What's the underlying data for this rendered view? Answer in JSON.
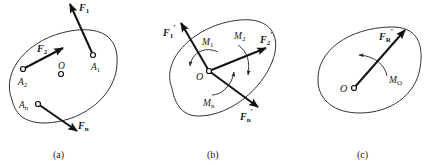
{
  "figure": {
    "panels": [
      {
        "id": "a",
        "caption": "(a)",
        "points": {
          "A1": "A",
          "A1_sub": "1",
          "A2": "A",
          "A2_sub": "2",
          "An": "A",
          "An_sub": "n",
          "O": "O"
        },
        "forces": {
          "F1": "F",
          "F1_sub": "1",
          "F2": "F",
          "F2_sub": "2",
          "Fn": "F",
          "Fn_sub": "n"
        }
      },
      {
        "id": "b",
        "caption": "(b)",
        "points": {
          "O": "O"
        },
        "forces": {
          "F1p": "F",
          "F1p_sub": "1",
          "F2p": "F",
          "F2p_sub": "2",
          "Fnp": "F",
          "Fnp_sub": "n",
          "prime": "′"
        },
        "moments": {
          "M1": "M",
          "M1_sub": "1",
          "M2": "M",
          "M2_sub": "2",
          "Mn": "M",
          "Mn_sub": "n"
        }
      },
      {
        "id": "c",
        "caption": "(c)",
        "points": {
          "O": "O"
        },
        "forces": {
          "FR": "F",
          "FR_sub": "R",
          "prime": "′"
        },
        "moments": {
          "MO": "M",
          "MO_sub": "O"
        }
      }
    ]
  }
}
